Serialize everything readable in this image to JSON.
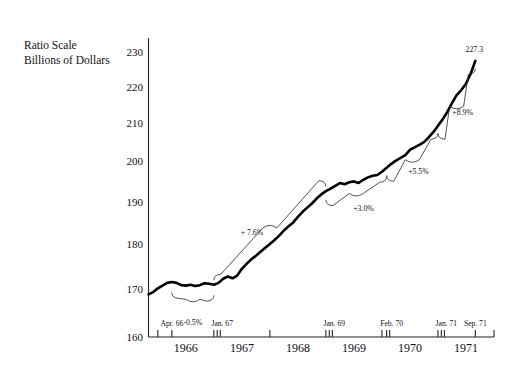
{
  "chart_data": {
    "type": "line",
    "title": "",
    "axis_note_line1": "Ratio Scale",
    "axis_note_line2": "Billions of Dollars",
    "xlabel": "",
    "ylabel": "Billions of Dollars",
    "scale": "ratio (logarithmic)",
    "grid": false,
    "legend": "none",
    "ylim": [
      160,
      234
    ],
    "yticks": [
      160,
      170,
      180,
      190,
      200,
      210,
      220,
      230
    ],
    "ytick_labels": [
      "160",
      "170",
      "180",
      "190",
      "200",
      "210",
      "220",
      "230"
    ],
    "xlim": [
      "1965-10",
      "1971-12"
    ],
    "year_labels": [
      "1966",
      "1967",
      "1968",
      "1969",
      "1970",
      "1971"
    ],
    "date_tick_labels": [
      "Apr. 66",
      "Jan. 67",
      "Jan. 69",
      "Feb. 70",
      "Jan. 71",
      "Sep. 71"
    ],
    "endpoint_label": "227.3",
    "annotations": [
      {
        "label": "-0.5%",
        "segment": "Apr. 66 to Jan. 67"
      },
      {
        "label": "+ 7.6%",
        "segment": "Jan. 67 to Jan. 69"
      },
      {
        "label": "+3.0%",
        "segment": "Jan. 69 to Feb. 70"
      },
      {
        "label": "+5.5%",
        "segment": "Feb. 70 to Jan. 71"
      },
      {
        "label": "+8.9%",
        "segment": "Jan. 71 to Sep. 71"
      }
    ],
    "series": [
      {
        "name": "Money Supply",
        "x": [
          "1965-11",
          "1965-12",
          "1966-01",
          "1966-02",
          "1966-03",
          "1966-04",
          "1966-05",
          "1966-06",
          "1966-07",
          "1966-08",
          "1966-09",
          "1966-10",
          "1966-11",
          "1966-12",
          "1967-01",
          "1967-02",
          "1967-03",
          "1967-04",
          "1967-05",
          "1967-06",
          "1967-07",
          "1967-08",
          "1967-09",
          "1967-10",
          "1967-11",
          "1967-12",
          "1968-01",
          "1968-02",
          "1968-03",
          "1968-04",
          "1968-05",
          "1968-06",
          "1968-07",
          "1968-08",
          "1968-09",
          "1968-10",
          "1968-11",
          "1968-12",
          "1969-01",
          "1969-02",
          "1969-03",
          "1969-04",
          "1969-05",
          "1969-06",
          "1969-07",
          "1969-08",
          "1969-09",
          "1969-10",
          "1969-11",
          "1969-12",
          "1970-01",
          "1970-02",
          "1970-03",
          "1970-04",
          "1970-05",
          "1970-06",
          "1970-07",
          "1970-08",
          "1970-09",
          "1970-10",
          "1970-11",
          "1970-12",
          "1971-01",
          "1971-02",
          "1971-03",
          "1971-04",
          "1971-05",
          "1971-06",
          "1971-07",
          "1971-08",
          "1971-09"
        ],
        "values": [
          168.9,
          169.4,
          170.2,
          170.8,
          171.4,
          171.6,
          171.4,
          170.9,
          170.8,
          171.0,
          170.7,
          170.9,
          171.3,
          171.2,
          171.0,
          171.4,
          172.3,
          172.8,
          172.4,
          173.0,
          174.5,
          175.6,
          176.6,
          177.4,
          178.3,
          179.2,
          180.1,
          181.0,
          182.0,
          183.2,
          184.2,
          185.1,
          186.4,
          187.6,
          188.6,
          189.6,
          190.8,
          191.8,
          192.6,
          193.2,
          193.9,
          194.6,
          194.3,
          194.8,
          195.0,
          194.6,
          195.4,
          196.0,
          196.4,
          196.6,
          197.4,
          198.4,
          199.4,
          200.2,
          200.9,
          201.6,
          203.0,
          203.6,
          204.3,
          205.0,
          206.2,
          207.6,
          209.3,
          211.0,
          213.0,
          215.4,
          217.6,
          219.0,
          220.8,
          223.6,
          227.3
        ]
      }
    ]
  }
}
